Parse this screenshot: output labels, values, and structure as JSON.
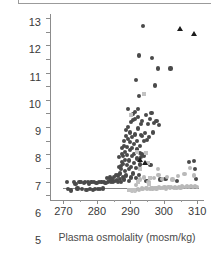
{
  "chart_data": {
    "type": "scatter",
    "title": "",
    "xlabel": "Plasma osmolality (mosm/kg)",
    "ylabel": "Plasma arginine vasopressin (pg/mL)",
    "xlim": [
      266,
      312
    ],
    "ylim": [
      -0.35,
      13.3
    ],
    "xticks": [
      270,
      280,
      290,
      300,
      310
    ],
    "yticks": [
      0,
      1,
      2,
      3,
      4,
      5,
      6,
      7,
      8,
      9,
      10,
      11,
      12,
      13
    ],
    "xminor_step": 5,
    "grid": false,
    "legend_position": "none",
    "reference_line": {
      "y": 0.5,
      "style": "solid-thin",
      "color": "#6f6f6f"
    },
    "colors": {
      "dark_circle": "#4a4a4a",
      "light_circle": "#b9b9b9",
      "light_square": "#c2c2c2",
      "black_triangle": "#1c1c1c",
      "axis": "#8c8c8c",
      "text": "#3a3a3a"
    },
    "series": [
      {
        "name": "dark-circles",
        "marker": "circle",
        "color": "#4a4a4a",
        "points": [
          [
            271.2,
            0.95
          ],
          [
            271.4,
            0.45
          ],
          [
            272.3,
            0.35
          ],
          [
            273.1,
            0.95
          ],
          [
            273.6,
            0.85
          ],
          [
            274.2,
            0.5
          ],
          [
            274.8,
            0.95
          ],
          [
            275.3,
            1.0
          ],
          [
            275.6,
            0.45
          ],
          [
            276.1,
            0.9
          ],
          [
            276.5,
            1.0
          ],
          [
            276.9,
            0.4
          ],
          [
            277.3,
            0.95
          ],
          [
            277.6,
            0.85
          ],
          [
            278.0,
            0.45
          ],
          [
            278.4,
            0.95
          ],
          [
            278.8,
            0.4
          ],
          [
            279.2,
            1.0
          ],
          [
            279.5,
            0.45
          ],
          [
            279.9,
            0.9
          ],
          [
            280.3,
            0.45
          ],
          [
            280.7,
            1.0
          ],
          [
            281.0,
            0.45
          ],
          [
            281.4,
            0.95
          ],
          [
            281.8,
            0.5
          ],
          [
            282.2,
            1.0
          ],
          [
            282.6,
            0.9
          ],
          [
            283.0,
            1.25
          ],
          [
            283.3,
            0.95
          ],
          [
            283.7,
            1.05
          ],
          [
            284.0,
            1.3
          ],
          [
            284.3,
            0.95
          ],
          [
            284.6,
            1.15
          ],
          [
            284.9,
            1.0
          ],
          [
            285.2,
            1.35
          ],
          [
            285.5,
            1.05
          ],
          [
            285.8,
            1.5
          ],
          [
            286.0,
            1.1
          ],
          [
            286.2,
            0.95
          ],
          [
            286.4,
            1.45
          ],
          [
            286.6,
            2.05
          ],
          [
            286.7,
            2.8
          ],
          [
            286.9,
            1.2
          ],
          [
            287.0,
            1.6
          ],
          [
            287.1,
            2.15
          ],
          [
            287.2,
            1.0
          ],
          [
            287.3,
            1.95
          ],
          [
            287.4,
            2.45
          ],
          [
            287.5,
            3.0
          ],
          [
            287.6,
            3.45
          ],
          [
            287.7,
            1.35
          ],
          [
            287.8,
            2.3
          ],
          [
            287.9,
            2.9
          ],
          [
            288.0,
            3.6
          ],
          [
            288.1,
            4.0
          ],
          [
            288.2,
            1.15
          ],
          [
            288.3,
            1.75
          ],
          [
            288.4,
            2.6
          ],
          [
            288.5,
            3.2
          ],
          [
            288.6,
            4.35
          ],
          [
            288.7,
            4.8
          ],
          [
            288.8,
            1.45
          ],
          [
            288.9,
            2.2
          ],
          [
            289.0,
            2.95
          ],
          [
            289.1,
            3.55
          ],
          [
            289.2,
            4.15
          ],
          [
            289.3,
            5.0
          ],
          [
            289.4,
            6.35
          ],
          [
            289.5,
            1.05
          ],
          [
            289.6,
            1.9
          ],
          [
            289.7,
            2.55
          ],
          [
            289.8,
            3.3
          ],
          [
            289.9,
            3.9
          ],
          [
            290.0,
            4.6
          ],
          [
            290.1,
            5.4
          ],
          [
            290.2,
            1.3
          ],
          [
            290.3,
            2.1
          ],
          [
            290.4,
            2.85
          ],
          [
            290.5,
            3.45
          ],
          [
            290.6,
            4.25
          ],
          [
            290.7,
            5.55
          ],
          [
            290.8,
            5.95
          ],
          [
            290.9,
            1.6
          ],
          [
            291.0,
            2.35
          ],
          [
            291.1,
            3.05
          ],
          [
            291.2,
            3.75
          ],
          [
            291.3,
            4.45
          ],
          [
            291.4,
            5.6
          ],
          [
            291.5,
            6.1
          ],
          [
            291.6,
            8.45
          ],
          [
            291.7,
            1.25
          ],
          [
            291.8,
            2.0
          ],
          [
            291.9,
            2.7
          ],
          [
            292.0,
            3.35
          ],
          [
            292.1,
            4.0
          ],
          [
            292.2,
            4.9
          ],
          [
            292.3,
            5.75
          ],
          [
            292.4,
            6.3
          ],
          [
            292.5,
            7.3
          ],
          [
            292.6,
            10.25
          ],
          [
            292.7,
            1.5
          ],
          [
            292.8,
            2.25
          ],
          [
            292.9,
            3.1
          ],
          [
            293.0,
            3.6
          ],
          [
            293.1,
            4.4
          ],
          [
            293.2,
            5.2
          ],
          [
            293.3,
            2.8
          ],
          [
            293.4,
            3.0
          ],
          [
            293.5,
            4.35
          ],
          [
            293.6,
            5.45
          ],
          [
            293.7,
            12.4
          ],
          [
            294.0,
            2.85
          ],
          [
            294.2,
            3.95
          ],
          [
            294.4,
            4.55
          ],
          [
            294.6,
            5.9
          ],
          [
            294.8,
            1.05
          ],
          [
            295.0,
            4.05
          ],
          [
            295.2,
            5.25
          ],
          [
            295.5,
            4.25
          ],
          [
            295.8,
            5.6
          ],
          [
            296.0,
            2.2
          ],
          [
            296.3,
            6.05
          ],
          [
            296.5,
            10.05
          ],
          [
            296.8,
            4.6
          ],
          [
            297.0,
            5.3
          ],
          [
            297.4,
            8.05
          ],
          [
            297.8,
            5.45
          ],
          [
            298.2,
            9.3
          ],
          [
            298.6,
            5.15
          ],
          [
            299.0,
            1.15
          ],
          [
            300.5,
            1.2
          ],
          [
            302.0,
            9.3
          ],
          [
            304.0,
            1.05
          ],
          [
            307.5,
            2.45
          ],
          [
            309.0,
            2.5
          ],
          [
            309.4,
            1.9
          ],
          [
            309.6,
            1.2
          ]
        ]
      },
      {
        "name": "light-circles",
        "marker": "circle",
        "color": "#b9b9b9",
        "points": [
          [
            290.2,
            0.4
          ],
          [
            290.6,
            0.35
          ],
          [
            291.0,
            0.4
          ],
          [
            291.4,
            0.35
          ],
          [
            291.8,
            0.75
          ],
          [
            292.2,
            0.45
          ],
          [
            292.6,
            0.4
          ],
          [
            293.0,
            1.15
          ],
          [
            293.4,
            0.5
          ],
          [
            293.8,
            0.45
          ],
          [
            294.2,
            1.3
          ],
          [
            294.6,
            0.55
          ],
          [
            295.0,
            0.5
          ],
          [
            295.4,
            1.0
          ],
          [
            295.8,
            0.45
          ],
          [
            296.2,
            0.55
          ],
          [
            296.6,
            0.5
          ],
          [
            297.0,
            1.25
          ],
          [
            297.4,
            0.55
          ],
          [
            297.8,
            0.5
          ],
          [
            298.2,
            1.95
          ],
          [
            298.4,
            1.5
          ],
          [
            298.6,
            0.6
          ],
          [
            299.0,
            0.55
          ],
          [
            299.4,
            1.2
          ],
          [
            299.8,
            0.55
          ],
          [
            300.2,
            0.6
          ],
          [
            300.6,
            0.5
          ],
          [
            301.0,
            1.35
          ],
          [
            301.4,
            0.6
          ],
          [
            301.8,
            0.55
          ],
          [
            302.2,
            0.6
          ],
          [
            302.6,
            1.15
          ],
          [
            303.0,
            0.55
          ],
          [
            303.4,
            0.6
          ],
          [
            303.8,
            0.55
          ],
          [
            304.2,
            1.4
          ],
          [
            304.6,
            0.6
          ],
          [
            305.0,
            0.55
          ],
          [
            305.4,
            0.65
          ],
          [
            305.8,
            0.6
          ],
          [
            306.2,
            1.55
          ],
          [
            306.6,
            0.6
          ],
          [
            307.0,
            0.65
          ],
          [
            307.4,
            0.6
          ],
          [
            307.8,
            2.0
          ],
          [
            308.2,
            0.65
          ],
          [
            308.6,
            0.6
          ],
          [
            309.0,
            1.45
          ],
          [
            309.4,
            0.7
          ],
          [
            309.8,
            0.6
          ]
        ]
      },
      {
        "name": "light-squares",
        "marker": "square",
        "color": "#c2c2c2",
        "points": [
          [
            290.2,
            5.9
          ],
          [
            292.0,
            3.2
          ],
          [
            294.0,
            7.4
          ],
          [
            294.6,
            3.1
          ],
          [
            295.2,
            2.4
          ],
          [
            293.0,
            1.95
          ],
          [
            296.0,
            1.3
          ],
          [
            289.6,
            0.35
          ],
          [
            290.0,
            0.35
          ],
          [
            290.4,
            0.35
          ],
          [
            291.2,
            0.4
          ],
          [
            292.4,
            1.0
          ],
          [
            295.6,
            0.8
          ]
        ]
      },
      {
        "name": "black-triangles",
        "marker": "triangle",
        "color": "#1c1c1c",
        "points": [
          [
            304.8,
            12.2
          ],
          [
            309.0,
            11.85
          ],
          [
            293.0,
            2.6
          ],
          [
            294.3,
            2.35
          ]
        ]
      }
    ]
  }
}
